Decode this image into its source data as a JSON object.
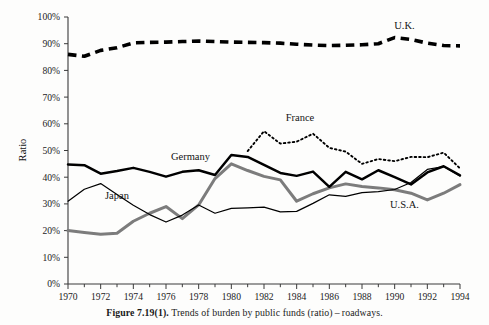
{
  "figure": {
    "caption_label": "Figure 7.19(1).",
    "caption_body": "Trends of burden by public funds (ratio) – roadways."
  },
  "chart_data": {
    "type": "line",
    "title": "",
    "subtitle": "",
    "xlabel": "",
    "ylabel": "Ratio",
    "xlim": [
      1970,
      1994
    ],
    "ylim": [
      0,
      100
    ],
    "y_unit": "%",
    "grid": false,
    "legend_position": "inline-annotations",
    "x": [
      1970,
      1971,
      1972,
      1973,
      1974,
      1975,
      1976,
      1977,
      1978,
      1979,
      1980,
      1981,
      1982,
      1983,
      1984,
      1985,
      1986,
      1987,
      1988,
      1989,
      1990,
      1991,
      1992,
      1993,
      1994
    ],
    "y_ticks": [
      0,
      10,
      20,
      30,
      40,
      50,
      60,
      70,
      80,
      90,
      100
    ],
    "y_tick_labels": [
      "0%",
      "10%",
      "20%",
      "30%",
      "40%",
      "50%",
      "60%",
      "70%",
      "80%",
      "90%",
      "100%"
    ],
    "x_ticks": [
      1970,
      1971,
      1972,
      1973,
      1974,
      1975,
      1976,
      1977,
      1978,
      1979,
      1980,
      1981,
      1982,
      1983,
      1984,
      1985,
      1986,
      1987,
      1988,
      1989,
      1990,
      1991,
      1992,
      1993,
      1994
    ],
    "x_tick_labels": [
      "1970",
      "",
      "1972",
      "",
      "1974",
      "",
      "1976",
      "",
      "1978",
      "",
      "1980",
      "",
      "1982",
      "",
      "1984",
      "",
      "1986",
      "",
      "1988",
      "",
      "1990",
      "",
      "1992",
      "",
      "1994"
    ],
    "series": [
      {
        "name": "U.K.",
        "label": "U.K.",
        "style": "thick-dashed",
        "color": "#000000",
        "label_x": 1990.6,
        "label_y": 95.5,
        "x": [
          1970,
          1971,
          1972,
          1973,
          1974,
          1975,
          1976,
          1977,
          1978,
          1979,
          1980,
          1981,
          1982,
          1983,
          1984,
          1985,
          1986,
          1987,
          1988,
          1989,
          1990,
          1991,
          1992,
          1993,
          1994
        ],
        "values": [
          86.0,
          85.3,
          87.5,
          88.5,
          90.3,
          90.5,
          90.6,
          90.8,
          91.0,
          90.8,
          90.6,
          90.5,
          90.4,
          90.2,
          89.8,
          89.5,
          89.3,
          89.4,
          89.6,
          90.0,
          92.3,
          91.6,
          90.2,
          89.3,
          89.2
        ]
      },
      {
        "name": "France",
        "label": "France",
        "style": "dotted",
        "color": "#000000",
        "label_x": 1984.2,
        "label_y": 61.0,
        "x": [
          1981,
          1982,
          1983,
          1984,
          1985,
          1986,
          1987,
          1988,
          1989,
          1990,
          1991,
          1992,
          1993,
          1994
        ],
        "values": [
          49.8,
          57.2,
          52.6,
          53.3,
          56.3,
          51.0,
          49.6,
          45.0,
          46.8,
          46.0,
          47.6,
          47.5,
          49.2,
          43.3
        ]
      },
      {
        "name": "Germany",
        "label": "Germany",
        "style": "thick-solid",
        "color": "#000000",
        "label_x": 1977.5,
        "label_y": 46.6,
        "x": [
          1970,
          1971,
          1972,
          1973,
          1974,
          1975,
          1976,
          1977,
          1978,
          1979,
          1980,
          1981,
          1982,
          1983,
          1984,
          1985,
          1986,
          1987,
          1988,
          1989,
          1990,
          1991,
          1992,
          1993,
          1994
        ],
        "values": [
          44.8,
          44.5,
          41.3,
          42.3,
          43.5,
          42.0,
          40.2,
          42.0,
          42.6,
          40.8,
          48.3,
          47.6,
          44.6,
          41.6,
          40.5,
          42.1,
          36.4,
          42.0,
          39.2,
          42.6,
          40.0,
          37.3,
          41.8,
          44.1,
          40.7
        ]
      },
      {
        "name": "U.S.A.",
        "label": "U.S.A.",
        "style": "thick-gray",
        "color": "#7c7c7c",
        "label_x": 1990.6,
        "label_y": 28.3,
        "x": [
          1970,
          1971,
          1972,
          1973,
          1974,
          1975,
          1976,
          1977,
          1978,
          1979,
          1980,
          1981,
          1982,
          1983,
          1984,
          1985,
          1986,
          1987,
          1988,
          1989,
          1990,
          1991,
          1992,
          1993,
          1994
        ],
        "values": [
          20.0,
          19.3,
          18.6,
          19.0,
          23.5,
          26.5,
          29.0,
          24.5,
          29.6,
          39.5,
          45.0,
          42.5,
          40.3,
          39.0,
          31.0,
          33.8,
          36.0,
          37.5,
          36.5,
          36.0,
          35.3,
          34.0,
          31.5,
          34.0,
          37.2
        ]
      },
      {
        "name": "Japan",
        "label": "Japan",
        "style": "thin-solid",
        "color": "#000000",
        "label_x": 1973.0,
        "label_y": 32.0,
        "x": [
          1970,
          1971,
          1972,
          1973,
          1974,
          1975,
          1976,
          1977,
          1978,
          1979,
          1980,
          1981,
          1982,
          1983,
          1984,
          1985,
          1986,
          1987,
          1988,
          1989,
          1990,
          1991,
          1992,
          1993,
          1994
        ],
        "values": [
          31.0,
          35.5,
          37.6,
          33.5,
          29.5,
          26.0,
          23.2,
          25.8,
          29.6,
          26.5,
          28.3,
          28.5,
          28.8,
          27.0,
          27.2,
          30.2,
          33.4,
          32.8,
          34.2,
          34.6,
          35.4,
          38.0,
          42.9,
          44.0,
          40.5
        ]
      }
    ]
  }
}
